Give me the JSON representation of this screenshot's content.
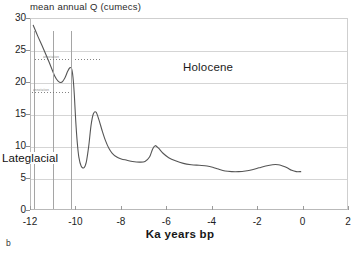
{
  "figure": {
    "panel_label": "b",
    "y_axis_title": "mean annual Q (cumecs)",
    "x_axis_title": "Ka years bp"
  },
  "annotations": {
    "holocene": "Holocene",
    "lateglacial": "Lateglacial",
    "faint_upper": "annotation",
    "faint_lower": "annotation"
  },
  "chart_data": {
    "type": "line",
    "title": "",
    "xlabel": "Ka years bp",
    "ylabel": "mean annual Q (cumecs)",
    "xlim": [
      -12,
      2
    ],
    "ylim": [
      0,
      30
    ],
    "xticks": [
      -12,
      -10,
      -8,
      -6,
      -4,
      -2,
      0,
      2
    ],
    "xticklabels": [
      "-12",
      "-10",
      "-8",
      "-6",
      "-4",
      "-2",
      "0",
      "2"
    ],
    "yticks": [
      0,
      5,
      10,
      15,
      20,
      25,
      30
    ],
    "yticklabels": [
      "0",
      "5",
      "10",
      "15",
      "20",
      "25",
      "30"
    ],
    "grid": true,
    "legend": "none",
    "series": [
      {
        "name": "mean annual Q",
        "color": "#555555",
        "x": [
          -11.9,
          -11.7,
          -11.45,
          -11.2,
          -10.95,
          -10.8,
          -10.65,
          -10.5,
          -10.38,
          -10.28,
          -10.2,
          -10.14,
          -10.08,
          -10.02,
          -9.95,
          -9.88,
          -9.78,
          -9.66,
          -9.55,
          -9.44,
          -9.34,
          -9.24,
          -9.12,
          -9.0,
          -8.85,
          -8.7,
          -8.55,
          -8.4,
          -8.2,
          -8.0,
          -7.75,
          -7.5,
          -7.2,
          -6.95,
          -6.75,
          -6.62,
          -6.5,
          -6.35,
          -6.15,
          -5.9,
          -5.6,
          -5.25,
          -4.9,
          -4.55,
          -4.2,
          -3.95,
          -3.7,
          -3.4,
          -3.1,
          -2.8,
          -2.5,
          -2.2,
          -1.9,
          -1.6,
          -1.3,
          -1.05,
          -0.85,
          -0.65,
          -0.45,
          -0.25,
          -0.05
        ],
        "y": [
          29.0,
          27.3,
          25.3,
          23.2,
          21.0,
          20.2,
          20.0,
          20.7,
          21.7,
          22.3,
          22.1,
          20.8,
          18.0,
          14.0,
          10.5,
          8.2,
          6.8,
          6.5,
          7.4,
          10.0,
          13.2,
          15.0,
          15.3,
          14.2,
          12.4,
          10.8,
          9.6,
          8.8,
          8.2,
          7.9,
          7.7,
          7.5,
          7.4,
          7.5,
          8.2,
          9.4,
          10.0,
          9.6,
          8.8,
          8.1,
          7.6,
          7.2,
          7.0,
          6.9,
          6.8,
          6.6,
          6.3,
          6.0,
          5.9,
          5.9,
          6.0,
          6.2,
          6.5,
          6.8,
          7.0,
          7.0,
          6.8,
          6.5,
          6.1,
          5.9,
          5.9
        ]
      }
    ],
    "zone_dividers": [
      -11.85,
      -11.05,
      -10.22
    ],
    "zones": [
      {
        "label": "Lateglacial",
        "x_start": -12.0,
        "x_end": -10.0
      },
      {
        "label": "Holocene",
        "x_start": -10.0,
        "x_end": 2.0
      }
    ]
  }
}
